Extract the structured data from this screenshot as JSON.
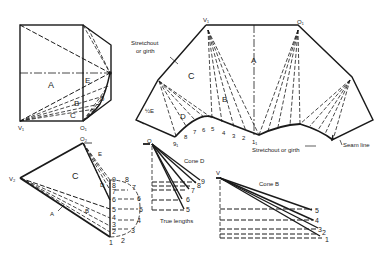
{
  "figure": {
    "colors": {
      "ink": "#1a1a1a",
      "paper": "#ffffff"
    }
  },
  "plan_view": {
    "labels": {
      "area_a": "A",
      "area_b": "B",
      "area_c": "C",
      "area_d": "D",
      "area_e": "E",
      "vertex_v1": "V₁",
      "vertex_o1": "O₁",
      "vertex_o2_partial": "O₂"
    }
  },
  "development": {
    "labels": {
      "vertex_v1": "V₁",
      "vertex_o1": "O₁",
      "area_a": "A",
      "area_b": "B",
      "area_c": "C",
      "area_d": "D",
      "half_e": "½E",
      "point_9_1": "9₁",
      "point_1_1": "1₁",
      "stretchout_top": [
        "Stretchout",
        "or girth"
      ],
      "stretchout_bottom": "Stretchout or girth",
      "seam_line": "Seam line"
    },
    "girth_numbers": [
      "8",
      "7",
      "6",
      "5",
      "4",
      "3",
      "2"
    ]
  },
  "elevation_view": {
    "labels": {
      "vertex_o2": "O₂",
      "vertex_v2": "V₂",
      "area_a": "A",
      "area_b": "B",
      "area_c": "C",
      "area_d": "D",
      "area_e": "E"
    },
    "inner_numbers": [
      "9",
      "8",
      "7",
      "6",
      "5",
      "4",
      "3",
      "2",
      "1"
    ],
    "outer_numbers": [
      "8",
      "7",
      "6",
      "5",
      "4",
      "3",
      "2"
    ]
  },
  "cone_d": {
    "title": "Cone D",
    "apex": "O",
    "caption": "True lengths",
    "line_numbers": [
      "9",
      "8",
      "7",
      "6",
      "5"
    ]
  },
  "cone_b": {
    "title": "Cone B",
    "apex": "V",
    "line_numbers": [
      "5",
      "4",
      "3",
      "2",
      "1"
    ]
  }
}
